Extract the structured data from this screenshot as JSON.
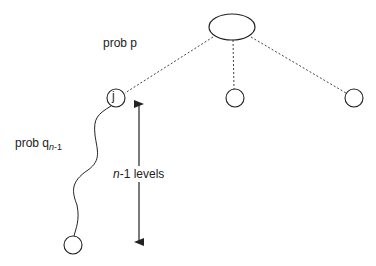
{
  "diagram": {
    "labels": {
      "prob_p": "prob p",
      "prob_q_base": "prob q",
      "prob_q_sub_n": "n",
      "prob_q_sub_rest": "-1",
      "levels_n": "n",
      "levels_rest": "-1 levels"
    },
    "nodes": {
      "root": {
        "label": ""
      },
      "j": {
        "label": "j"
      },
      "middle": {
        "label": ""
      },
      "right": {
        "label": ""
      },
      "leaf": {
        "label": ""
      }
    },
    "colors": {
      "stroke": "#222222",
      "background": "#ffffff"
    }
  }
}
